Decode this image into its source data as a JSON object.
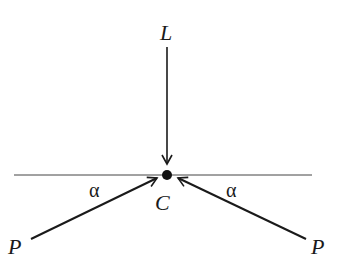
{
  "diagram": {
    "labels": {
      "top": "L",
      "center": "C",
      "bottom_left": "P",
      "bottom_right": "P",
      "angle_left": "α",
      "angle_right": "α"
    },
    "colors": {
      "stroke": "#1a1a1a",
      "baseline": "#444444"
    }
  }
}
